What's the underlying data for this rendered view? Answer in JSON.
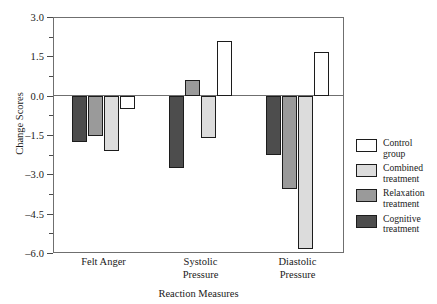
{
  "chart_data": {
    "type": "bar",
    "title": "",
    "xlabel": "Reaction Measures",
    "ylabel": "Change Scores",
    "ylim": [
      -6.0,
      3.0
    ],
    "ytick_labels": [
      "3.0",
      "1.5",
      "0.0",
      "-1.5",
      "-3.0",
      "-4.5",
      "-6.0"
    ],
    "ytick_values": [
      3.0,
      1.5,
      0.0,
      -1.5,
      -3.0,
      -4.5,
      -6.0
    ],
    "minor_tick_step": 0.75,
    "grid": false,
    "legend_position": "right",
    "categories": [
      "Felt Anger",
      "Systolic Pressure",
      "Diastolic Pressure"
    ],
    "series": [
      {
        "name": "Cognitive treatment",
        "color": "#4d4d4d",
        "values": [
          -1.75,
          -2.75,
          -2.25
        ]
      },
      {
        "name": "Relaxation treatment",
        "color": "#9a9a9a",
        "values": [
          -1.55,
          0.6,
          -3.55
        ]
      },
      {
        "name": "Combined treatment",
        "color": "#dcdcdc",
        "values": [
          -2.1,
          -1.6,
          -5.85
        ]
      },
      {
        "name": "Control group",
        "color": "#ffffff",
        "values": [
          -0.5,
          2.1,
          1.65
        ]
      }
    ]
  },
  "legend": {
    "items": [
      {
        "label_line1": "Control",
        "label_line2": "group",
        "color": "#ffffff",
        "icon": "legend-swatch-control"
      },
      {
        "label_line1": "Combined",
        "label_line2": "treatment",
        "color": "#dcdcdc",
        "icon": "legend-swatch-combined"
      },
      {
        "label_line1": "Relaxation",
        "label_line2": "treatment",
        "color": "#9a9a9a",
        "icon": "legend-swatch-relaxation"
      },
      {
        "label_line1": "Cognitive",
        "label_line2": "treatment",
        "color": "#4d4d4d",
        "icon": "legend-swatch-cognitive"
      }
    ]
  },
  "xlabels": [
    {
      "line1": "Felt Anger",
      "line2": ""
    },
    {
      "line1": "Systolic",
      "line2": "Pressure"
    },
    {
      "line1": "Diastolic",
      "line2": "Pressure"
    }
  ],
  "axis_titles": {
    "x": "Reaction Measures",
    "y": "Change Scores"
  }
}
